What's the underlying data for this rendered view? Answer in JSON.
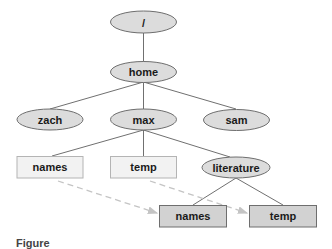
{
  "diagram": {
    "type": "directory-tree",
    "colors": {
      "ellipse_fill": "#dcdcdc",
      "ellipse_stroke": "#6e6e6e",
      "box_light_fill": "#f2f2f2",
      "box_light_stroke": "#b4b4b4",
      "box_dark_fill": "#d2d2d2",
      "box_dark_stroke": "#6e6e6e",
      "edge": "#707070",
      "link_dashed": "#c4c4c4"
    },
    "nodes": {
      "root": {
        "label": "/",
        "shape": "ellipse"
      },
      "home": {
        "label": "home",
        "shape": "ellipse"
      },
      "zach": {
        "label": "zach",
        "shape": "ellipse"
      },
      "max": {
        "label": "max",
        "shape": "ellipse"
      },
      "sam": {
        "label": "sam",
        "shape": "ellipse"
      },
      "names_link": {
        "label": "names",
        "shape": "box-light"
      },
      "temp_link": {
        "label": "temp",
        "shape": "box-light"
      },
      "literature": {
        "label": "literature",
        "shape": "ellipse"
      },
      "names_file": {
        "label": "names",
        "shape": "box-dark"
      },
      "temp_file": {
        "label": "temp",
        "shape": "box-dark"
      }
    },
    "edges": [
      {
        "from": "root",
        "to": "home"
      },
      {
        "from": "home",
        "to": "zach"
      },
      {
        "from": "home",
        "to": "max"
      },
      {
        "from": "home",
        "to": "sam"
      },
      {
        "from": "max",
        "to": "names_link"
      },
      {
        "from": "max",
        "to": "temp_link"
      },
      {
        "from": "max",
        "to": "literature"
      },
      {
        "from": "literature",
        "to": "names_file"
      },
      {
        "from": "literature",
        "to": "temp_file"
      }
    ],
    "links": [
      {
        "from": "names_link",
        "to": "names_file",
        "style": "dashed-arrow"
      },
      {
        "from": "temp_link",
        "to": "temp_file",
        "style": "dashed-arrow"
      }
    ]
  },
  "caption": {
    "text": "Figure"
  }
}
